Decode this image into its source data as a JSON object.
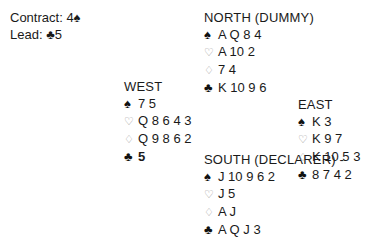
{
  "info": {
    "contract_label": "Contract:",
    "contract_value": "4",
    "contract_suit": "♠",
    "lead_label": "Lead:",
    "lead_suit": "♣",
    "lead_value": "5"
  },
  "hands": {
    "north": {
      "title": "NORTH (DUMMY)",
      "spades": "A Q 8 4",
      "hearts": "A 10 2",
      "diamonds": "7 4",
      "clubs": "K 10 9 6"
    },
    "west": {
      "title": "WEST",
      "spades": "7 5",
      "hearts": "Q 8 6 4 3",
      "diamonds": "Q 9 8 6 2",
      "clubs": "5"
    },
    "east": {
      "title": "EAST",
      "spades": "K 3",
      "hearts": "K 9 7",
      "diamonds": "K 10 5 3",
      "clubs": "8 7 4 2"
    },
    "south": {
      "title": "SOUTH (DECLARER) -",
      "spades": "J 10 9 6 2",
      "hearts": "J 5",
      "diamonds": "A J",
      "clubs": "A Q J 3"
    }
  },
  "suit_symbols": {
    "spades": "♠",
    "hearts": "♡",
    "diamonds": "♢",
    "clubs": "♣"
  }
}
